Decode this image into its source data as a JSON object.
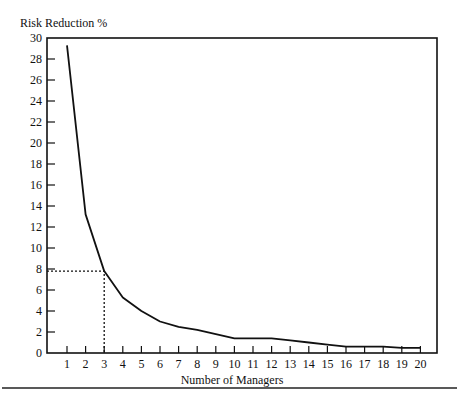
{
  "chart_data": {
    "type": "line",
    "title": "",
    "ylabel": "Risk Reduction %",
    "xlabel": "Number of Managers",
    "x": [
      1,
      2,
      3,
      4,
      5,
      6,
      7,
      8,
      9,
      10,
      11,
      12,
      13,
      14,
      15,
      16,
      17,
      18,
      19,
      20
    ],
    "series": [
      {
        "name": "Risk Reduction",
        "values": [
          29.3,
          13.2,
          7.8,
          5.3,
          4.0,
          3.0,
          2.5,
          2.2,
          1.8,
          1.4,
          1.4,
          1.4,
          1.2,
          1.0,
          0.8,
          0.6,
          0.6,
          0.6,
          0.5,
          0.5
        ]
      }
    ],
    "ylim": [
      0,
      30
    ],
    "xlim": [
      0,
      21
    ],
    "yticks": [
      0,
      2,
      4,
      6,
      8,
      10,
      12,
      14,
      16,
      18,
      20,
      22,
      24,
      26,
      28,
      30
    ],
    "xticks": [
      1,
      2,
      3,
      4,
      5,
      6,
      7,
      8,
      9,
      10,
      11,
      12,
      13,
      14,
      15,
      16,
      17,
      18,
      19,
      20
    ],
    "grid": false,
    "annotations": [
      {
        "type": "dotted-guide",
        "x": 3,
        "y": 7.8,
        "description": "dotted lines from x=3 up to curve and across to y-axis at ~7.8"
      }
    ]
  }
}
